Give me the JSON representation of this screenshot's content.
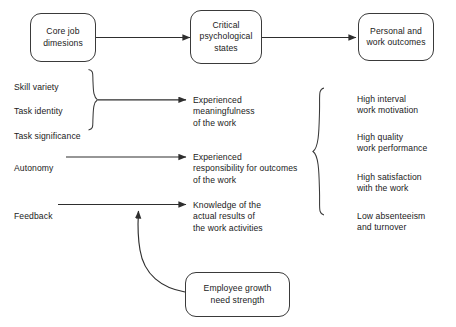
{
  "diagram": {
    "title_row": {
      "core": "Core job\ndimesions",
      "states": "Critical\npsychological\nstates",
      "outcomes": "Personal and\nwork outcomes"
    },
    "job_dimensions": [
      {
        "label": "Skill variety"
      },
      {
        "label": "Task identity"
      },
      {
        "label": "Task significance"
      },
      {
        "label": "Autonomy"
      },
      {
        "label": "Feedback"
      }
    ],
    "psychological_states": [
      {
        "label": "Experienced\nmeaningfulness\nof the work"
      },
      {
        "label": "Experienced\nresponsibility for outcomes\nof the work"
      },
      {
        "label": "Knowledge of the\nactual results of\nthe work activities"
      }
    ],
    "work_outcomes": [
      {
        "label": "High interval\nwork motivation"
      },
      {
        "label": "High quality\nwork performance"
      },
      {
        "label": "High satisfaction\nwith the work"
      },
      {
        "label": "Low absenteeism\nand turnover"
      }
    ],
    "moderator": {
      "label": "Employee growth\nneed strength"
    },
    "colors": {
      "stroke": "#3a3a3a",
      "text": "#1a1a1a",
      "background": "#ffffff"
    }
  }
}
